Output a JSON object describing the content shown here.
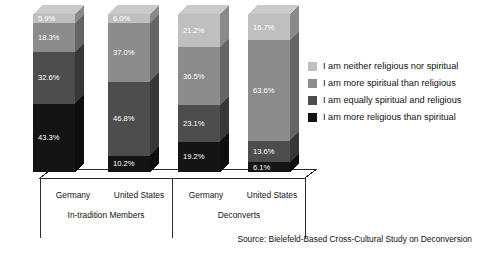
{
  "chart_data": {
    "type": "bar",
    "title": "",
    "subtitle": "",
    "xlabel": "",
    "ylabel": "",
    "ylim": [
      0,
      100
    ],
    "grid": false,
    "stacked": true,
    "stack_total": 100,
    "orientation": "vertical",
    "legend_position": "right",
    "value_suffix": "%",
    "categories": [
      "Germany",
      "United States",
      "Germany",
      "United States"
    ],
    "groups": [
      {
        "label": "In-tradition Members",
        "categories": [
          "Germany",
          "United States"
        ]
      },
      {
        "label": "Deconverts",
        "categories": [
          "Germany",
          "United States"
        ]
      }
    ],
    "series": [
      {
        "name": "I am neither religious nor spiritual",
        "color": "#bfbfbf",
        "values": [
          5.9,
          6.0,
          21.2,
          16.7
        ],
        "labels": [
          "5.9%",
          "6.0%",
          "21.2%",
          "16.7%"
        ]
      },
      {
        "name": "I am more spiritual than religious",
        "color": "#8c8c8c",
        "values": [
          18.3,
          37.0,
          36.5,
          63.6
        ],
        "labels": [
          "18.3%",
          "37.0%",
          "36.5%",
          "63.6%"
        ]
      },
      {
        "name": "I am equally spiritual and religious",
        "color": "#4d4d4d",
        "values": [
          32.6,
          46.8,
          23.1,
          13.6
        ],
        "labels": [
          "32.6%",
          "46.8%",
          "23.1%",
          "13.6%"
        ]
      },
      {
        "name": "I am more religious than spiritual",
        "color": "#141414",
        "values": [
          43.3,
          10.2,
          19.2,
          6.1
        ],
        "labels": [
          "43.3%",
          "10.2%",
          "19.2%",
          "6.1%"
        ]
      }
    ],
    "legend": [
      {
        "label": "I am neither religious nor spiritual",
        "color": "#bfbfbf"
      },
      {
        "label": "I am more spiritual than religious",
        "color": "#8c8c8c"
      },
      {
        "label": "I am equally spiritual and religious",
        "color": "#4d4d4d"
      },
      {
        "label": "I am more religious than spiritual",
        "color": "#141414"
      }
    ],
    "annotations": {
      "source": "Source: Bielefeld-Based Cross-Cultural Study on Deconversion"
    }
  },
  "bar_values": {
    "b0s0": "5.9%",
    "b0s1": "18.3%",
    "b0s2": "32.6%",
    "b0s3": "43.3%",
    "b1s0": "6.0%",
    "b1s1": "37.0%",
    "b1s2": "46.8%",
    "b1s3": "10.2%",
    "b2s0": "21.2%",
    "b2s1": "36.5%",
    "b2s2": "23.1%",
    "b2s3": "19.2%",
    "b3s0": "16.7%",
    "b3s1": "63.6%",
    "b3s2": "13.6%",
    "b3s3": "6.1%"
  },
  "legend_labels": {
    "l0": "I am neither religious nor spiritual",
    "l1": "I am more spiritual than religious",
    "l2": "I am equally spiritual and religious",
    "l3": "I am more religious than spiritual"
  },
  "axis_labels": {
    "c0": "Germany",
    "c1": "United States",
    "c2": "Germany",
    "c3": "United States",
    "g0": "In-tradition Members",
    "g1": "Deconverts"
  },
  "footer": {
    "source": "Source: Bielefeld-Based Cross-Cultural Study on Deconversion"
  },
  "colors": {
    "neither": "#bfbfbf",
    "more_spiritual": "#8c8c8c",
    "equally": "#4d4d4d",
    "more_religious": "#141414",
    "line": "#2b2b2b",
    "background": "#ffffff"
  }
}
